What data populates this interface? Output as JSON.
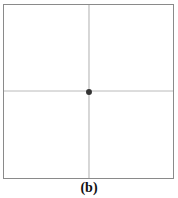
{
  "figure": {
    "label": "(b)",
    "colors": {
      "frame": "#8a8a8a",
      "axis_line": "#9a9a9a",
      "center": "#3a3a3a",
      "halo": "#b8b8b8",
      "background": "#ffffff"
    }
  }
}
